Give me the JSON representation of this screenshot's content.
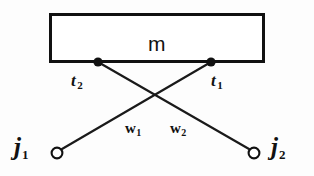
{
  "figure": {
    "type": "schematic-diagram",
    "width": 314,
    "height": 176,
    "background_color": "#fdfdfd",
    "ink_color": "#111111"
  },
  "module": {
    "label": "m",
    "shape": "rectangle",
    "x": 49,
    "y": 13,
    "width": 216,
    "height": 50,
    "border_width": 3,
    "fill": "#ffffff"
  },
  "terminals": [
    {
      "id": "t2",
      "name": "t",
      "subscript": "2",
      "marker": "filled-dot",
      "cx": 98,
      "cy": 62,
      "r": 4.5
    },
    {
      "id": "t1",
      "name": "t",
      "subscript": "1",
      "marker": "filled-dot",
      "cx": 211,
      "cy": 62,
      "r": 4.5
    }
  ],
  "junctions": [
    {
      "id": "j1",
      "name": "j",
      "subscript": "1",
      "marker": "open-circle",
      "cx": 57,
      "cy": 153,
      "r": 5.5
    },
    {
      "id": "j2",
      "name": "j",
      "subscript": "2",
      "marker": "open-circle",
      "cx": 254,
      "cy": 153,
      "r": 5.5
    }
  ],
  "wires": [
    {
      "id": "w1",
      "name": "w",
      "subscript": "1",
      "from": "t2",
      "to": "j2",
      "x1": 98,
      "y1": 62,
      "x2": 249,
      "y2": 149,
      "stroke_width": 2.2
    },
    {
      "id": "w2",
      "name": "w",
      "subscript": "2",
      "from": "t1",
      "to": "j1",
      "x1": 211,
      "y1": 62,
      "x2": 62,
      "y2": 149,
      "stroke_width": 2.2
    }
  ],
  "crossing_point": {
    "x": 158,
    "y": 98
  }
}
